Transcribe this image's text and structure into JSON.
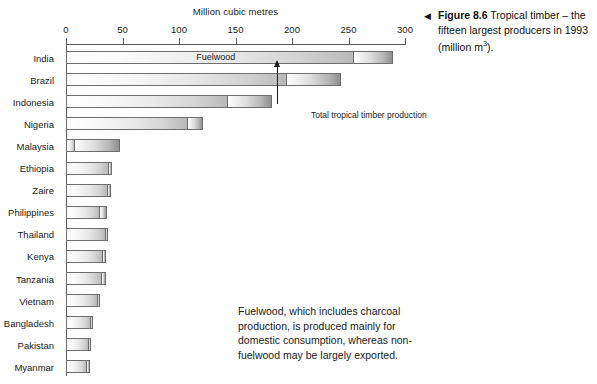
{
  "axis_title": "Million cubic metres",
  "inline_label": "Fuelwood",
  "annotation": "Total tropical timber production",
  "note": "Fuelwood, which includes charcoal production, is produced mainly for domestic consumption, whereas non-fuelwood may be largely exported.",
  "caption": {
    "marker": "◀",
    "figure_number": "Figure 8.6",
    "text_part1": " Tropical timber – the fifteen largest producers in 1993 (million m",
    "superscript": "3",
    "text_part2": ")."
  },
  "chart_data": {
    "type": "bar",
    "orientation": "horizontal",
    "title": "Tropical timber – the fifteen largest producers in 1993 (million m3)",
    "xlabel": "Million cubic metres",
    "ylabel": "",
    "xlim": [
      0,
      310
    ],
    "xticks": [
      0,
      50,
      100,
      150,
      200,
      250,
      300
    ],
    "xtick_labels": [
      "0",
      "50",
      "100",
      "150",
      "200",
      "250",
      "300"
    ],
    "grid": false,
    "legend": [
      "Fuelwood",
      "Non-fuelwood"
    ],
    "categories": [
      "India",
      "Brazil",
      "Indonesia",
      "Nigeria",
      "Malaysia",
      "Ethiopia",
      "Zaire",
      "Philippines",
      "Thailand",
      "Kenya",
      "Tanzania",
      "Vietnam",
      "Bangladesh",
      "Pakistan",
      "Myanmar"
    ],
    "series": [
      {
        "name": "Fuelwood",
        "values": [
          255,
          196,
          143,
          108,
          8,
          38,
          37,
          30,
          35,
          33,
          32,
          28,
          22,
          20,
          19
        ]
      },
      {
        "name": "Non-fuelwood",
        "values": [
          34,
          47,
          39,
          13,
          40,
          3,
          3,
          6,
          2,
          2,
          3,
          2,
          2,
          2,
          2
        ]
      },
      {
        "name": "Total",
        "values": [
          289,
          243,
          182,
          121,
          48,
          41,
          40,
          36,
          37,
          35,
          35,
          30,
          24,
          22,
          21
        ]
      }
    ]
  }
}
